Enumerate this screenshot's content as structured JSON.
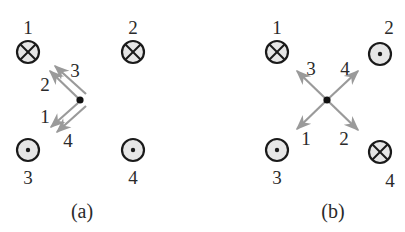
{
  "panels": [
    {
      "caption": "(a)",
      "wires": [
        {
          "label": "1",
          "direction": "into-page",
          "symbol": "cross"
        },
        {
          "label": "2",
          "direction": "into-page",
          "symbol": "cross"
        },
        {
          "label": "3",
          "direction": "out-of-page",
          "symbol": "dot"
        },
        {
          "label": "4",
          "direction": "out-of-page",
          "symbol": "dot"
        }
      ],
      "field_vectors": [
        {
          "label": "1",
          "direction": "down-left"
        },
        {
          "label": "2",
          "direction": "up-left"
        },
        {
          "label": "3",
          "direction": "up-left"
        },
        {
          "label": "4",
          "direction": "down-left"
        }
      ]
    },
    {
      "caption": "(b)",
      "wires": [
        {
          "label": "1",
          "direction": "into-page",
          "symbol": "cross"
        },
        {
          "label": "2",
          "direction": "out-of-page",
          "symbol": "dot"
        },
        {
          "label": "3",
          "direction": "out-of-page",
          "symbol": "dot"
        },
        {
          "label": "4",
          "direction": "into-page",
          "symbol": "cross"
        }
      ],
      "field_vectors": [
        {
          "label": "1",
          "direction": "down-left"
        },
        {
          "label": "2",
          "direction": "down-right"
        },
        {
          "label": "3",
          "direction": "up-left"
        },
        {
          "label": "4",
          "direction": "up-right"
        }
      ]
    }
  ],
  "colors": {
    "ink": "#1a1a1a",
    "wire_fill": "#e6e6e6",
    "vector": "#9a9a9a"
  }
}
